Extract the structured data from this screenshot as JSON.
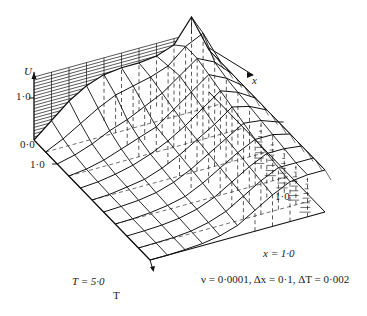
{
  "chart_data": {
    "type": "surface3d",
    "title": "",
    "variables": {
      "dependent": "U",
      "independent": [
        "x",
        "T"
      ]
    },
    "axes": {
      "U": {
        "label": "U",
        "ticks": [
          "0·0",
          "1·0"
        ],
        "range": [
          0,
          1.5
        ]
      },
      "x": {
        "label": "x",
        "end_label": "x = 1·0",
        "range": [
          0,
          1.0
        ],
        "step": 0.1
      },
      "T": {
        "label": "T",
        "ticks": [
          "1·0"
        ],
        "end_label": "T = 5·0",
        "range": [
          0,
          5.0
        ],
        "step": 0.5
      },
      "U_right_tick": "1·0"
    },
    "annotation": "ν = 0·0001, Δx = 0·1, ΔT = 0·002",
    "x": [
      0.0,
      0.1,
      0.2,
      0.3,
      0.4,
      0.5,
      0.6,
      0.7,
      0.8,
      0.9,
      1.0
    ],
    "T": [
      0.0,
      0.5,
      1.0,
      1.5,
      2.0,
      2.5,
      3.0,
      3.5,
      4.0,
      4.5,
      5.0
    ],
    "series": [
      {
        "name": "T=0.0",
        "values": [
          0.0,
          0.35,
          0.7,
          0.95,
          1.1,
          1.15,
          1.15,
          1.2,
          1.35,
          1.9,
          1.0
        ]
      },
      {
        "name": "T=0.5",
        "values": [
          0.0,
          0.2,
          0.45,
          0.7,
          0.9,
          1.0,
          1.1,
          1.25,
          1.6,
          1.8,
          1.0
        ]
      },
      {
        "name": "T=1.0",
        "values": [
          0.0,
          0.1,
          0.25,
          0.45,
          0.6,
          0.8,
          1.0,
          1.3,
          1.6,
          1.4,
          1.0
        ]
      },
      {
        "name": "T=1.5",
        "values": [
          0.0,
          0.05,
          0.15,
          0.3,
          0.45,
          0.6,
          0.9,
          1.2,
          1.5,
          1.3,
          1.0
        ]
      },
      {
        "name": "T=2.0",
        "values": [
          0.0,
          0.03,
          0.1,
          0.2,
          0.35,
          0.55,
          0.8,
          1.1,
          1.4,
          1.25,
          1.0
        ]
      },
      {
        "name": "T=2.5",
        "values": [
          0.0,
          0.02,
          0.08,
          0.15,
          0.3,
          0.5,
          0.75,
          1.0,
          1.3,
          1.2,
          1.0
        ]
      },
      {
        "name": "T=3.0",
        "values": [
          0.0,
          0.02,
          0.05,
          0.12,
          0.25,
          0.45,
          0.7,
          0.95,
          1.2,
          1.15,
          1.0
        ]
      },
      {
        "name": "T=3.5",
        "values": [
          0.0,
          0.01,
          0.04,
          0.1,
          0.2,
          0.4,
          0.65,
          0.9,
          1.1,
          1.1,
          1.0
        ]
      },
      {
        "name": "T=4.0",
        "values": [
          0.0,
          0.01,
          0.03,
          0.08,
          0.18,
          0.35,
          0.6,
          0.85,
          1.05,
          1.05,
          1.0
        ]
      },
      {
        "name": "T=4.5",
        "values": [
          0.0,
          0.01,
          0.02,
          0.06,
          0.15,
          0.3,
          0.55,
          0.8,
          1.0,
          1.0,
          1.0
        ]
      },
      {
        "name": "T=5.0",
        "values": [
          0.0,
          0.0,
          0.02,
          0.05,
          0.12,
          0.25,
          0.5,
          0.75,
          0.95,
          1.0,
          1.0
        ]
      }
    ]
  }
}
